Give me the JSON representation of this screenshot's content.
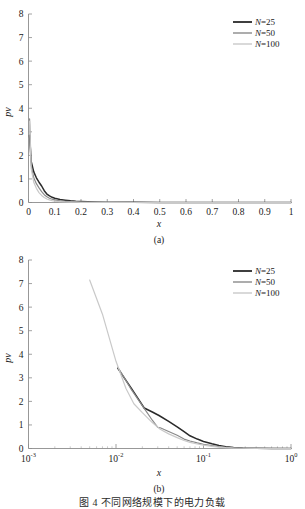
{
  "figure": {
    "caption": "图 4  不同网络规模下的电力负载",
    "panels": [
      {
        "id": "a",
        "subcaption": "(a)"
      },
      {
        "id": "b",
        "subcaption": "(b)"
      }
    ]
  },
  "legend": {
    "position": "top-right",
    "entries": [
      {
        "label": "N=25",
        "name_part": "N",
        "value_part": "=25",
        "color": "#2a2a2a"
      },
      {
        "label": "N=50",
        "name_part": "N",
        "value_part": "=50",
        "color": "#8a8a8a"
      },
      {
        "label": "N=100",
        "name_part": "N",
        "value_part": "=100",
        "color": "#c9c9c9"
      }
    ]
  },
  "colors": {
    "n25": "#2a2a2a",
    "n50": "#8a8a8a",
    "n100": "#c9c9c9",
    "axis": "#8c8c8c",
    "text": "#1a1a1a"
  },
  "chart_data": [
    {
      "type": "line",
      "panel": "a",
      "title": "",
      "subcaption": "(a)",
      "xlabel": "x",
      "ylabel": "pv",
      "xscale": "linear",
      "yscale": "linear",
      "xlim": [
        0,
        1
      ],
      "ylim": [
        0,
        8
      ],
      "xticks": [
        "0",
        "0.1",
        "0.2",
        "0.3",
        "0.4",
        "0.5",
        "0.6",
        "0.7",
        "0.8",
        "0.9",
        "1"
      ],
      "xtick_values": [
        0,
        0.1,
        0.2,
        0.3,
        0.4,
        0.5,
        0.6,
        0.7,
        0.8,
        0.9,
        1
      ],
      "yticks": [
        "0",
        "1",
        "2",
        "3",
        "4",
        "5",
        "6",
        "7",
        "8"
      ],
      "ytick_values": [
        0,
        1,
        2,
        3,
        4,
        5,
        6,
        7,
        8
      ],
      "grid": false,
      "legend_position": "top-right",
      "series": [
        {
          "name": "N=25",
          "color": "#2a2a2a",
          "x": [
            0.004,
            0.01,
            0.02,
            0.03,
            0.04,
            0.05,
            0.06,
            0.07,
            0.08,
            0.09,
            0.1,
            0.12,
            0.14,
            0.16,
            0.18,
            0.2,
            0.25,
            0.3,
            0.4,
            0.5,
            0.7,
            1.0
          ],
          "y": [
            2.85,
            1.75,
            1.3,
            1.05,
            0.86,
            0.7,
            0.5,
            0.36,
            0.28,
            0.22,
            0.18,
            0.13,
            0.1,
            0.07,
            0.05,
            0.04,
            0.02,
            0.012,
            0.006,
            0.003,
            0.001,
            0.0
          ]
        },
        {
          "name": "N=50",
          "color": "#8a8a8a",
          "x": [
            0.004,
            0.01,
            0.02,
            0.03,
            0.04,
            0.05,
            0.06,
            0.07,
            0.08,
            0.09,
            0.1,
            0.12,
            0.14,
            0.16,
            0.18,
            0.2,
            0.25,
            0.3,
            0.4,
            0.5,
            0.7,
            1.0
          ],
          "y": [
            3.55,
            1.6,
            1.05,
            0.8,
            0.62,
            0.46,
            0.33,
            0.24,
            0.18,
            0.14,
            0.11,
            0.07,
            0.05,
            0.035,
            0.025,
            0.018,
            0.01,
            0.006,
            0.003,
            0.001,
            0.0,
            0.0
          ]
        },
        {
          "name": "N=100",
          "color": "#c9c9c9",
          "x": [
            0.004,
            0.01,
            0.02,
            0.03,
            0.04,
            0.05,
            0.06,
            0.07,
            0.08,
            0.09,
            0.1,
            0.12,
            0.14,
            0.16,
            0.18,
            0.2,
            0.25,
            0.3,
            0.4,
            0.5,
            0.7,
            1.0
          ],
          "y": [
            3.45,
            1.45,
            0.86,
            0.6,
            0.42,
            0.3,
            0.21,
            0.15,
            0.11,
            0.08,
            0.06,
            0.04,
            0.025,
            0.018,
            0.012,
            0.009,
            0.005,
            0.003,
            0.001,
            0.0,
            0.0,
            0.0
          ]
        }
      ]
    },
    {
      "type": "line",
      "panel": "b",
      "title": "",
      "subcaption": "(b)",
      "xlabel": "x",
      "ylabel": "pv",
      "xscale": "log",
      "yscale": "linear",
      "xlim": [
        0.001,
        1
      ],
      "ylim": [
        0,
        8
      ],
      "xticks": [
        "10-3",
        "10-2",
        "10-1",
        "100"
      ],
      "xtick_values": [
        0.001,
        0.01,
        0.1,
        1
      ],
      "yticks": [
        "0",
        "1",
        "2",
        "3",
        "4",
        "5",
        "6",
        "7",
        "8"
      ],
      "ytick_values": [
        0,
        1,
        2,
        3,
        4,
        5,
        6,
        7,
        8
      ],
      "grid": false,
      "legend_position": "top-right",
      "series": [
        {
          "name": "N=25",
          "color": "#2a2a2a",
          "x": [
            0.0105,
            0.015,
            0.021,
            0.026,
            0.031,
            0.04,
            0.05,
            0.06,
            0.07,
            0.085,
            0.1,
            0.125,
            0.15,
            0.18,
            0.22,
            0.28,
            0.4,
            0.6,
            1.0
          ],
          "y": [
            3.4,
            2.55,
            1.72,
            1.55,
            1.4,
            1.15,
            0.92,
            0.72,
            0.54,
            0.4,
            0.3,
            0.2,
            0.13,
            0.08,
            0.04,
            0.02,
            0.008,
            0.003,
            0.0
          ]
        },
        {
          "name": "N=50",
          "color": "#8a8a8a",
          "x": [
            0.0105,
            0.015,
            0.021,
            0.026,
            0.03,
            0.032,
            0.04,
            0.05,
            0.06,
            0.07,
            0.085,
            0.1,
            0.125,
            0.15,
            0.18,
            0.22,
            0.28,
            0.4,
            0.6,
            1.0
          ],
          "y": [
            3.45,
            2.5,
            1.7,
            1.2,
            0.9,
            0.88,
            0.72,
            0.56,
            0.4,
            0.32,
            0.24,
            0.18,
            0.12,
            0.08,
            0.05,
            0.03,
            0.015,
            0.006,
            0.002,
            0.0
          ]
        },
        {
          "name": "N=100",
          "color": "#c9c9c9",
          "x": [
            0.005,
            0.007,
            0.01,
            0.013,
            0.016,
            0.02,
            0.026,
            0.032,
            0.04,
            0.05,
            0.06,
            0.07,
            0.085,
            0.1,
            0.125,
            0.15,
            0.18,
            0.22,
            0.28,
            0.4,
            0.6,
            1.0
          ],
          "y": [
            7.15,
            5.7,
            3.7,
            2.55,
            1.9,
            1.52,
            1.1,
            0.82,
            0.62,
            0.46,
            0.34,
            0.26,
            0.19,
            0.14,
            0.09,
            0.06,
            0.035,
            0.02,
            0.01,
            0.004,
            0.001,
            0.0
          ]
        }
      ]
    }
  ]
}
